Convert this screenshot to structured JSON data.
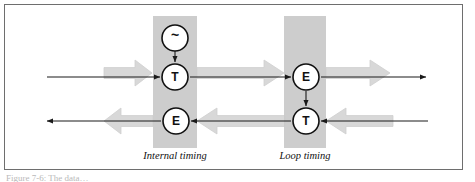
{
  "figure": {
    "background_color": "#ffffff",
    "frame_border_color": "#6e6e6e",
    "caption": "Figure 7-6: The data…"
  },
  "palette": {
    "fat_arrow_fill": "#d8d8d8",
    "fat_arrow_stroke": "#cfcfcf",
    "group_box_fill": "#c9c9c9",
    "line_color": "#1a1a1a",
    "node_fill": "#ffffff",
    "node_stroke": "#111111",
    "label_color": "#111111"
  },
  "groups": [
    {
      "id": "internal-timing",
      "caption": "Internal timing",
      "box": {
        "x": 153,
        "y": 16,
        "width": 44,
        "height": 132
      },
      "caption_pos": {
        "x": 175,
        "y": 159
      }
    },
    {
      "id": "loop-timing",
      "caption": "Loop timing",
      "box": {
        "x": 284,
        "y": 16,
        "width": 42,
        "height": 132
      },
      "caption_pos": {
        "x": 305,
        "y": 159
      }
    }
  ],
  "nodes": [
    {
      "id": "oscillator",
      "label": "~",
      "group": "internal-timing",
      "cx": 175,
      "cy": 38,
      "r": 13,
      "font_size": 14
    },
    {
      "id": "internal-transmit",
      "label": "T",
      "group": "internal-timing",
      "cx": 175,
      "cy": 77,
      "r": 13,
      "font_size": 12
    },
    {
      "id": "internal-receive",
      "label": "E",
      "group": "internal-timing",
      "cx": 176,
      "cy": 121,
      "r": 13,
      "font_size": 12
    },
    {
      "id": "loop-receive",
      "label": "E",
      "group": "loop-timing",
      "cx": 306,
      "cy": 77,
      "r": 13,
      "font_size": 12
    },
    {
      "id": "loop-transmit",
      "label": "T",
      "group": "loop-timing",
      "cx": 306,
      "cy": 121,
      "r": 13,
      "font_size": 12
    }
  ],
  "fat_arrows": [
    {
      "id": "fat-arrow-left-in",
      "direction": "right",
      "x1": 104,
      "y": 73,
      "x2": 152,
      "thickness": 26,
      "head": 17
    },
    {
      "id": "fat-arrow-middle-out",
      "direction": "right",
      "x1": 197,
      "y": 73,
      "x2": 284,
      "thickness": 26,
      "head": 20
    },
    {
      "id": "fat-arrow-right-out",
      "direction": "right",
      "x1": 326,
      "y": 73,
      "x2": 390,
      "thickness": 26,
      "head": 20
    },
    {
      "id": "fat-arrow-left-out",
      "direction": "left",
      "x1": 104,
      "y": 121,
      "x2": 153,
      "thickness": 26,
      "head": 17
    },
    {
      "id": "fat-arrow-middle-in",
      "direction": "left",
      "x1": 197,
      "y": 121,
      "x2": 285,
      "thickness": 26,
      "head": 20
    },
    {
      "id": "fat-arrow-right-in",
      "direction": "left",
      "x1": 326,
      "y": 121,
      "x2": 393,
      "thickness": 26,
      "head": 20
    }
  ],
  "signal_lines": [
    {
      "id": "line-left-in",
      "x1": 47,
      "y1": 77,
      "x2": 160,
      "y2": 77,
      "arrow": "end"
    },
    {
      "id": "line-internal-to-loop",
      "x1": 190,
      "y1": 77,
      "x2": 291,
      "y2": 77,
      "arrow": "end"
    },
    {
      "id": "line-loop-out",
      "x1": 321,
      "y1": 77,
      "x2": 426,
      "y2": 77,
      "arrow": "end"
    },
    {
      "id": "line-osc-to-t",
      "x1": 175,
      "y1": 51,
      "x2": 175,
      "y2": 62,
      "arrow": "end"
    },
    {
      "id": "line-loop-e-to-t",
      "x1": 306,
      "y1": 91,
      "x2": 306,
      "y2": 106,
      "arrow": "end"
    },
    {
      "id": "line-loop-in",
      "x1": 428,
      "y1": 121,
      "x2": 321,
      "y2": 121,
      "arrow": "end"
    },
    {
      "id": "line-loop-to-internal",
      "x1": 291,
      "y1": 121,
      "x2": 191,
      "y2": 121,
      "arrow": "end"
    },
    {
      "id": "line-left-out",
      "x1": 161,
      "y1": 121,
      "x2": 47,
      "y2": 121,
      "arrow": "end"
    }
  ]
}
